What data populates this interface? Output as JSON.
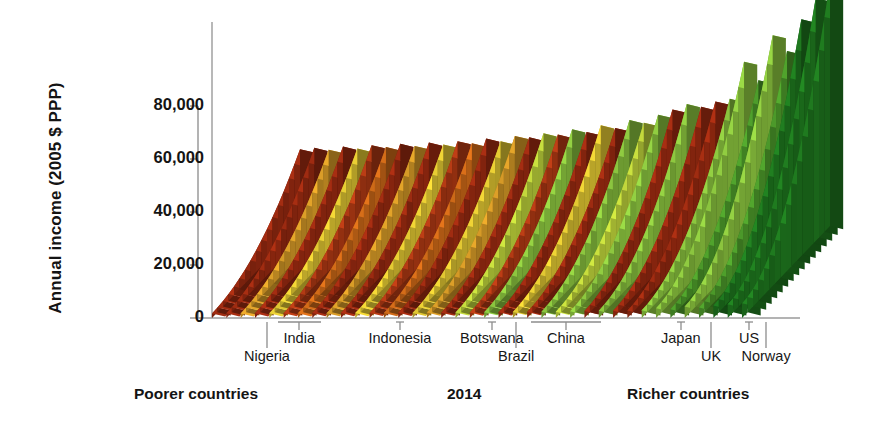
{
  "chart_data": {
    "type": "bar",
    "title": "",
    "subtitle": "",
    "ylabel": "Annual income (2005 $ PPP)",
    "xlabel": "",
    "ylim": [
      0,
      95000
    ],
    "yticks": [
      0,
      20000,
      40000,
      60000,
      80000
    ],
    "ytick_labels": [
      "0",
      "20,000",
      "40,000",
      "60,000",
      "80,000"
    ],
    "grid": false,
    "legend": false,
    "axis_note": "Countries ordered left (poorest) to right (richest); each country is a ribbon of income ventiles rising from poorest to richest citizen, drawn in 3-D perspective.",
    "x_captions": {
      "left": "Poorer countries",
      "center": "2014",
      "right": "Richer countries"
    },
    "country_markers": [
      {
        "label": "Nigeria",
        "x": 267,
        "row": 2,
        "tick": "long"
      },
      {
        "label": "India",
        "x": 299,
        "row": 1,
        "tick": "bracket",
        "span": [
          278,
          321
        ]
      },
      {
        "label": "Indonesia",
        "x": 400,
        "row": 1,
        "tick": "short"
      },
      {
        "label": "Botswana",
        "x": 492,
        "row": 1,
        "tick": "short"
      },
      {
        "label": "Brazil",
        "x": 516,
        "row": 2,
        "tick": "long"
      },
      {
        "label": "China",
        "x": 566,
        "row": 1,
        "tick": "bracket",
        "span": [
          531,
          601
        ]
      },
      {
        "label": "Japan",
        "x": 681,
        "row": 1,
        "tick": "short"
      },
      {
        "label": "UK",
        "x": 711,
        "row": 2,
        "tick": "long"
      },
      {
        "label": "US",
        "x": 749,
        "row": 1,
        "tick": "short"
      },
      {
        "label": "Norway",
        "x": 766,
        "row": 2,
        "tick": "long"
      }
    ],
    "palette": {
      "dark_red": "#9d2b11",
      "brick_red": "#b23a14",
      "orange": "#cf6a18",
      "amber": "#d79b27",
      "yellow": "#e2c832",
      "yellow_green": "#bcd13a",
      "light_green": "#8cc63f",
      "green": "#4c9a2a",
      "dark_green": "#1f7a1f",
      "axis": "#9a9a9a",
      "text": "#141414"
    },
    "series": [
      {
        "name": "ribbon",
        "x": 0,
        "top": 29000,
        "color": "dark_red"
      },
      {
        "name": "ribbon",
        "x": 3,
        "top": 29500,
        "color": "dark_red"
      },
      {
        "name": "ribbon",
        "x": 6,
        "top": 28800,
        "color": "amber"
      },
      {
        "name": "ribbon",
        "x": 9,
        "top": 30000,
        "color": "dark_red"
      },
      {
        "name": "ribbon",
        "x": 12,
        "top": 29200,
        "color": "yellow"
      },
      {
        "name": "ribbon",
        "x": 15,
        "top": 30500,
        "color": "brick_red"
      },
      {
        "name": "ribbon",
        "x": 18,
        "top": 29800,
        "color": "orange"
      },
      {
        "name": "ribbon",
        "x": 21,
        "top": 31000,
        "color": "dark_red"
      },
      {
        "name": "ribbon",
        "x": 24,
        "top": 30200,
        "color": "amber"
      },
      {
        "name": "ribbon",
        "x": 27,
        "top": 31500,
        "color": "dark_red"
      },
      {
        "name": "ribbon",
        "x": 30,
        "top": 30800,
        "color": "yellow"
      },
      {
        "name": "ribbon",
        "x": 33,
        "top": 32000,
        "color": "brick_red"
      },
      {
        "name": "ribbon",
        "x": 36,
        "top": 31200,
        "color": "orange"
      },
      {
        "name": "ribbon",
        "x": 39,
        "top": 33000,
        "color": "dark_red"
      },
      {
        "name": "ribbon",
        "x": 42,
        "top": 32000,
        "color": "yellow"
      },
      {
        "name": "ribbon",
        "x": 45,
        "top": 34000,
        "color": "amber"
      },
      {
        "name": "ribbon",
        "x": 48,
        "top": 33500,
        "color": "dark_red"
      },
      {
        "name": "ribbon",
        "x": 51,
        "top": 35000,
        "color": "yellow_green"
      },
      {
        "name": "ribbon",
        "x": 54,
        "top": 34500,
        "color": "brick_red"
      },
      {
        "name": "ribbon",
        "x": 57,
        "top": 36500,
        "color": "light_green"
      },
      {
        "name": "ribbon",
        "x": 60,
        "top": 35500,
        "color": "dark_red"
      },
      {
        "name": "ribbon",
        "x": 63,
        "top": 38000,
        "color": "yellow"
      },
      {
        "name": "ribbon",
        "x": 66,
        "top": 37000,
        "color": "dark_red"
      },
      {
        "name": "ribbon",
        "x": 69,
        "top": 40000,
        "color": "light_green"
      },
      {
        "name": "ribbon",
        "x": 72,
        "top": 39000,
        "color": "yellow_green"
      },
      {
        "name": "ribbon",
        "x": 75,
        "top": 42000,
        "color": "light_green"
      },
      {
        "name": "ribbon",
        "x": 78,
        "top": 44000,
        "color": "dark_red"
      },
      {
        "name": "ribbon",
        "x": 81,
        "top": 46000,
        "color": "light_green"
      },
      {
        "name": "ribbon",
        "x": 84,
        "top": 45000,
        "color": "dark_red"
      },
      {
        "name": "ribbon",
        "x": 87,
        "top": 47000,
        "color": "dark_red"
      },
      {
        "name": "ribbon",
        "x": 90,
        "top": 48000,
        "color": "light_green"
      },
      {
        "name": "ribbon",
        "x": 93,
        "top": 62000,
        "color": "light_green"
      },
      {
        "name": "ribbon",
        "x": 96,
        "top": 55000,
        "color": "green"
      },
      {
        "name": "ribbon",
        "x": 99,
        "top": 72000,
        "color": "light_green"
      },
      {
        "name": "ribbon",
        "x": 102,
        "top": 66000,
        "color": "green"
      },
      {
        "name": "ribbon",
        "x": 105,
        "top": 78000,
        "color": "dark_green"
      },
      {
        "name": "ribbon",
        "x": 108,
        "top": 86000,
        "color": "dark_green"
      },
      {
        "name": "ribbon",
        "x": 111,
        "top": 92000,
        "color": "dark_green"
      }
    ]
  },
  "figure": {
    "width": 869,
    "height": 427,
    "background": "#ffffff"
  }
}
